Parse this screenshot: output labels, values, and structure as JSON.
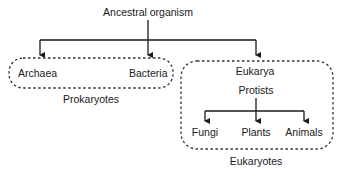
{
  "diagram": {
    "root": {
      "label": "Ancestral organism"
    },
    "prokaryotes": {
      "group_label": "Prokaryotes",
      "members": [
        {
          "label": "Archaea"
        },
        {
          "label": "Bacteria"
        }
      ]
    },
    "eukaryotes": {
      "group_label": "Eukaryotes",
      "domain_label": "Eukarya",
      "parent_label": "Protists",
      "members": [
        {
          "label": "Fungi"
        },
        {
          "label": "Plants"
        },
        {
          "label": "Animals"
        }
      ]
    },
    "colors": {
      "line": "#1a1a1a",
      "dashed_border": "#333333",
      "background": "#ffffff"
    }
  }
}
